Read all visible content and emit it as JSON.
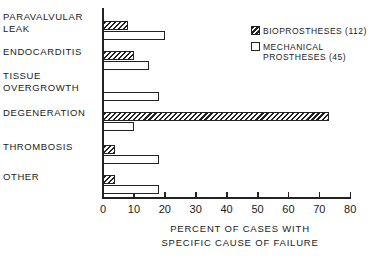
{
  "chart_data": {
    "type": "bar",
    "orientation": "horizontal",
    "title": "",
    "xlabel": "PERCENT OF CASES WITH\nSPECIFIC CAUSE OF FAILURE",
    "ylabel": "",
    "xlim": [
      0,
      80
    ],
    "xticks": [
      0,
      10,
      20,
      30,
      40,
      50,
      60,
      70,
      80
    ],
    "grid": false,
    "legend_position": "upper right",
    "categories": [
      "PARAVALVULAR\nLEAK",
      "ENDOCARDITIS",
      "TISSUE\nOVERGROWTH",
      "DEGENERATION",
      "THROMBOSIS",
      "OTHER"
    ],
    "series": [
      {
        "name": "BIOPROSTHESES (112)",
        "pattern": "hatched",
        "values": [
          8,
          10,
          0,
          73,
          4,
          4
        ]
      },
      {
        "name": "MECHANICAL\nPROSTHESES (45)",
        "pattern": "open",
        "values": [
          20,
          15,
          18,
          10,
          18,
          18
        ]
      }
    ]
  }
}
